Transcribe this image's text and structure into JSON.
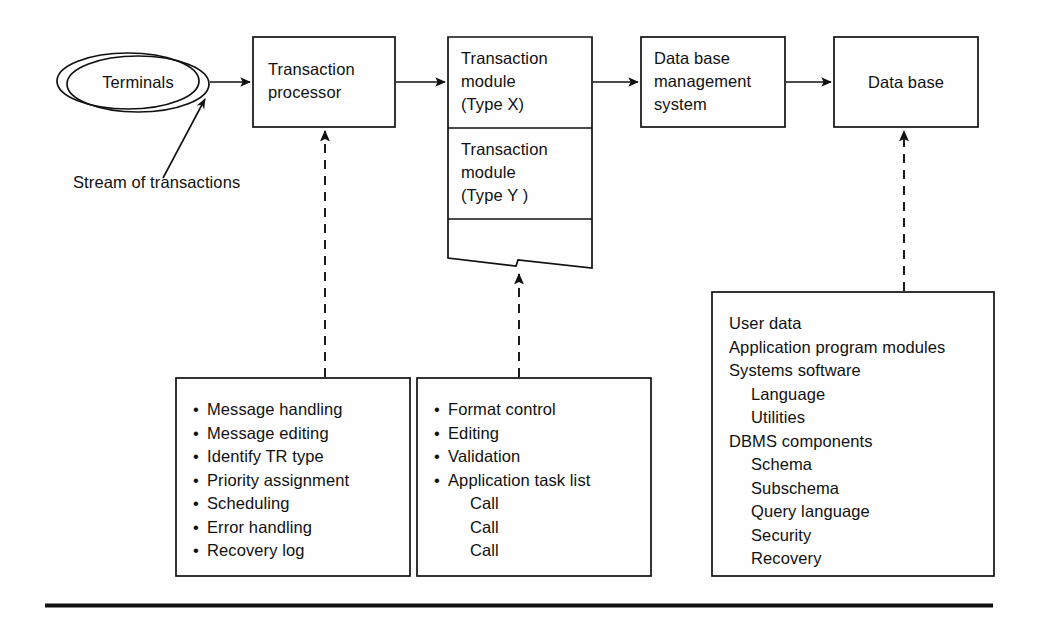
{
  "diagram": {
    "line_color": "#111111",
    "background_color": "#ffffff",
    "nodes": {
      "terminals": {
        "label": "Terminals",
        "shape": "stacked-ellipse"
      },
      "transaction_processor": {
        "line1": "Transaction",
        "line2": "processor"
      },
      "transaction_module_x": {
        "line1": "Transaction",
        "line2": "module",
        "line3": "(Type X)"
      },
      "transaction_module_y": {
        "line1": "Transaction",
        "line2": "module",
        "line3": "(Type Y )"
      },
      "dbms": {
        "line1": "Data base",
        "line2": "management",
        "line3": "system"
      },
      "database": {
        "label": "Data base"
      }
    },
    "annotations": {
      "stream_of_transactions": "Stream of transactions"
    },
    "detail_boxes": {
      "transaction_processor_detail": {
        "bulleted": true,
        "items": [
          "Message handling",
          "Message editing",
          "Identify TR type",
          "Priority assignment",
          "Scheduling",
          "Error handling",
          "Recovery log"
        ]
      },
      "transaction_module_detail": {
        "bulleted": true,
        "items": [
          "Format control",
          "Editing",
          "Validation",
          "Application task list"
        ],
        "sub_items": [
          "Call",
          "Call",
          "Call"
        ]
      },
      "database_detail": {
        "bulleted": false,
        "items": [
          {
            "text": "User data",
            "indent": 0
          },
          {
            "text": "Application program modules",
            "indent": 0
          },
          {
            "text": "Systems software",
            "indent": 0
          },
          {
            "text": "Language",
            "indent": 1
          },
          {
            "text": "Utilities",
            "indent": 1
          },
          {
            "text": "DBMS components",
            "indent": 0
          },
          {
            "text": "Schema",
            "indent": 1
          },
          {
            "text": "Subschema",
            "indent": 1
          },
          {
            "text": "Query language",
            "indent": 1
          },
          {
            "text": "Security",
            "indent": 1
          },
          {
            "text": "Recovery",
            "indent": 1
          }
        ]
      }
    }
  }
}
